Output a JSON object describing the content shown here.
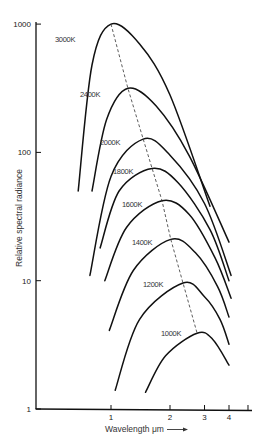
{
  "chart_data": {
    "type": "line",
    "title": "",
    "xlabel": "Wavelength μm →",
    "ylabel": "Relative spectral radiance",
    "xscale": "log",
    "yscale": "log",
    "xlim": [
      0.6,
      5
    ],
    "ylim": [
      1,
      1000
    ],
    "x_ticks": [
      1,
      2,
      3,
      4,
      5
    ],
    "x_tick_labels": [
      "1",
      "2",
      "3",
      "4",
      ""
    ],
    "y_ticks": [
      1,
      10,
      100,
      1000
    ],
    "y_tick_labels": [
      "1",
      "10",
      "100",
      "1000"
    ],
    "grid": false,
    "legend": "inline curve labels",
    "annotations": [
      "Dashed line connects peaks of each curve (Wien's displacement)"
    ],
    "series": [
      {
        "name": "3000K",
        "label": "3000K",
        "x": [
          0.68,
          0.8,
          1.0,
          1.4,
          2.0,
          3.2
        ],
        "y": [
          50,
          480,
          1000,
          700,
          280,
          38
        ],
        "peak": {
          "x": 1.0,
          "y": 1000
        }
      },
      {
        "name": "2400K",
        "label": "2400K",
        "x": [
          0.8,
          0.95,
          1.22,
          1.7,
          2.5,
          4.0
        ],
        "y": [
          50,
          180,
          316,
          230,
          95,
          20
        ],
        "peak": {
          "x": 1.22,
          "y": 316
        }
      },
      {
        "name": "2000K",
        "label": "2000K",
        "x": [
          0.78,
          1.0,
          1.46,
          2.0,
          3.0,
          4.1
        ],
        "y": [
          11,
          65,
          127,
          95,
          40,
          11
        ],
        "peak": {
          "x": 1.46,
          "y": 127
        }
      },
      {
        "name": "1800K",
        "label": "1800K",
        "x": [
          0.88,
          1.1,
          1.62,
          2.2,
          3.2,
          4.0
        ],
        "y": [
          18,
          50,
          75,
          58,
          25,
          10
        ],
        "peak": {
          "x": 1.62,
          "y": 75
        }
      },
      {
        "name": "1600K",
        "label": "1600K",
        "x": [
          0.93,
          1.2,
          1.82,
          2.5,
          3.4,
          4.1
        ],
        "y": [
          10,
          26,
          42,
          33,
          15,
          7.3
        ],
        "peak": {
          "x": 1.82,
          "y": 42
        }
      },
      {
        "name": "1400K",
        "label": "1400K",
        "x": [
          0.98,
          1.3,
          2.02,
          2.7,
          3.5,
          4.0
        ],
        "y": [
          4.1,
          12,
          21,
          16.5,
          9,
          5.2
        ],
        "peak": {
          "x": 2.02,
          "y": 21
        }
      },
      {
        "name": "1200K",
        "label": "1200K",
        "x": [
          1.05,
          1.4,
          2.33,
          3.0,
          3.6,
          4.0
        ],
        "y": [
          1.4,
          5,
          9.6,
          7.5,
          5,
          3.2
        ],
        "peak": {
          "x": 2.33,
          "y": 9.6
        }
      },
      {
        "name": "1000K",
        "label": "1000K",
        "x": [
          1.5,
          1.9,
          2.75,
          3.3,
          4.0
        ],
        "y": [
          1.35,
          2.6,
          3.9,
          3.5,
          2.2
        ],
        "peak": {
          "x": 2.75,
          "y": 3.9
        }
      }
    ]
  },
  "axes": {
    "y_label": "Relative spectral radiance",
    "x_label": "Wavelength μm",
    "x_arrow": "→"
  }
}
